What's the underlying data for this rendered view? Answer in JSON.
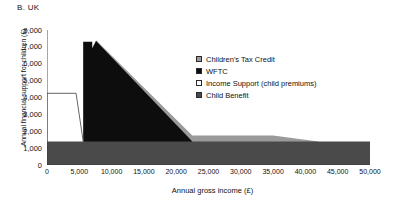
{
  "panel": {
    "title": "B. UK"
  },
  "axes": {
    "ylabel": "Annual financial support for children (£)",
    "xlabel": "Annual gross income (£)",
    "yticks": [
      "0",
      "1,000",
      "2,000",
      "3,000",
      "4,000",
      "5,000",
      "6,000",
      "7,000",
      "8,000"
    ],
    "xticks": [
      "0",
      "5,000",
      "10,000",
      "15,000",
      "20,000",
      "25,000",
      "30,000",
      "35,000",
      "40,000",
      "45,000",
      "50,000"
    ]
  },
  "legend": {
    "items": [
      {
        "label": "Children's Tax Credit",
        "color": "#9a9a9a",
        "swatch": "sw-ctc"
      },
      {
        "label": "WFTC",
        "color": "#0d0d0d",
        "swatch": "sw-wftc"
      },
      {
        "label": "Income Support (child premiums)",
        "color": "#ffffff",
        "swatch": "sw-is"
      },
      {
        "label": "Child Benefit",
        "color": "#4a4a4a",
        "swatch": "sw-cb"
      }
    ]
  },
  "chart_data": {
    "type": "area",
    "title": "B. UK",
    "xlabel": "Annual gross income (£)",
    "ylabel": "Annual financial support for children (£)",
    "xlim": [
      0,
      50000
    ],
    "ylim": [
      0,
      8000
    ],
    "xtick_step": 5000,
    "ytick_step": 1000,
    "grid": false,
    "legend_position": "inside-upper-right",
    "stacked": true,
    "series": [
      {
        "name": "Child Benefit",
        "color": "#4a4a4a",
        "points": [
          [
            0,
            1400
          ],
          [
            50000,
            1400
          ]
        ]
      },
      {
        "name": "Income Support (child premiums)",
        "color": "#ffffff",
        "points": [
          [
            0,
            4250
          ],
          [
            4500,
            4250
          ],
          [
            5600,
            1400
          ]
        ]
      },
      {
        "name": "WFTC",
        "color": "#0d0d0d",
        "points": [
          [
            5600,
            1400
          ],
          [
            5600,
            7300
          ],
          [
            7000,
            7300
          ],
          [
            7000,
            6900
          ],
          [
            7600,
            7350
          ],
          [
            22500,
            1400
          ]
        ]
      },
      {
        "name": "Children's Tax Credit",
        "color": "#9a9a9a",
        "points": [
          [
            7000,
            6950
          ],
          [
            7600,
            7400
          ],
          [
            22500,
            1750
          ],
          [
            35000,
            1750
          ],
          [
            42000,
            1400
          ]
        ]
      }
    ]
  }
}
